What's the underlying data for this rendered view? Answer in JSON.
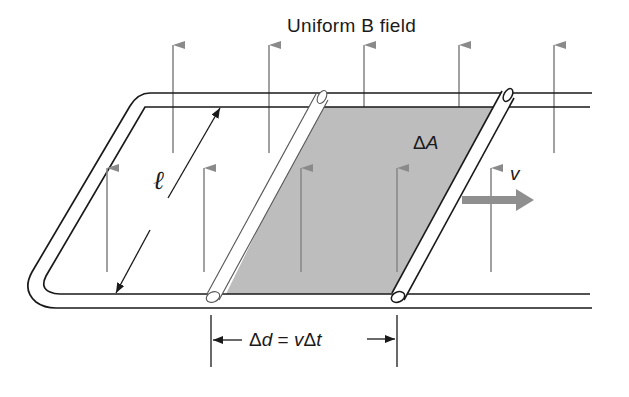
{
  "diagram": {
    "title": "Uniform B field",
    "labels": {
      "length": "ℓ",
      "area_delta": "Δ",
      "area_symbol": "A",
      "velocity": "v",
      "displacement_delta": "Δ",
      "displacement_symbol": "d",
      "equals": " = ",
      "velocity_symbol": "v",
      "time_delta": "Δ",
      "time_symbol": "t"
    },
    "colors": {
      "rail_stroke": "#1a1a1a",
      "field_arrow": "#8a8a8a",
      "shaded_area": "#bdbdbd",
      "velocity_arrow": "#8f8f8f",
      "rod_fill": "#ffffff"
    },
    "elements": [
      "U-shaped conducting rails",
      "stationary rod (original position)",
      "moving rod (new position)",
      "shaded swept area ΔA",
      "upward magnetic field arrows",
      "velocity arrow v",
      "length dimension ℓ",
      "displacement dimension Δd = vΔt"
    ]
  }
}
